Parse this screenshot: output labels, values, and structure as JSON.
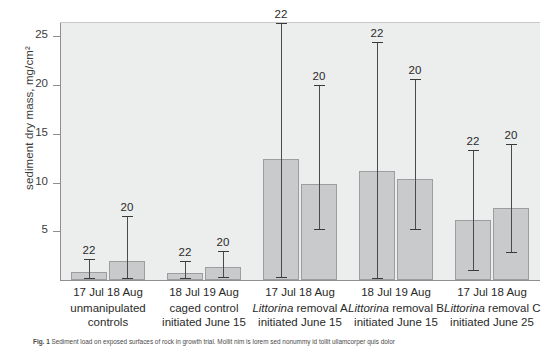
{
  "chart_data": {
    "type": "bar",
    "title": "",
    "xlabel": "",
    "ylabel": "sediment dry mass, mg/cm²",
    "ylim": [
      0,
      26.5
    ],
    "yticks": [
      5,
      10,
      15,
      20,
      25
    ],
    "ytick_labels": [
      "5",
      "10",
      "15",
      "20",
      "25"
    ],
    "grid": false,
    "legend": "none",
    "categories": [
      "unmanipulated controls",
      "caged control initiated June 15",
      "Littorina removal A initiated June 15",
      "Littorina removal B initiated June 15",
      "Littorina removal C initiated June 25"
    ],
    "series": [
      {
        "name": "July sampling",
        "values": [
          0.8,
          0.7,
          12.4,
          11.2,
          6.2
        ],
        "error_low": [
          0.2,
          0.2,
          0.3,
          0.2,
          1.0
        ],
        "error_high": [
          2.2,
          2.0,
          26.4,
          24.4,
          13.3
        ],
        "sample_sizes": [
          22,
          22,
          22,
          22,
          22
        ],
        "date_labels": [
          "17 Jul",
          "18 Jul",
          "17 Jul",
          "18 Jul",
          "17 Jul"
        ]
      },
      {
        "name": "August sampling",
        "values": [
          1.9,
          1.3,
          9.8,
          10.4,
          7.4
        ],
        "error_low": [
          0.2,
          0.3,
          5.2,
          5.2,
          2.9
        ],
        "error_high": [
          6.6,
          3.0,
          20.0,
          20.6,
          14.0
        ],
        "sample_sizes": [
          20,
          20,
          20,
          20,
          20
        ],
        "date_labels": [
          "18 Aug",
          "19 Aug",
          "18 Aug",
          "19 Aug",
          "18 Aug"
        ]
      }
    ],
    "colors": {
      "bar_fill": "#c9cacb",
      "bar_border": "#9b9d9e",
      "plot_background": "#eceded",
      "axis": "#8d8f90",
      "text": "#2a2a2a"
    }
  },
  "axis": {
    "y_label": "sediment dry mass, mg/cm²",
    "ticks": [
      {
        "value": "25"
      },
      {
        "value": "20"
      },
      {
        "value": "15"
      },
      {
        "value": "10"
      },
      {
        "value": "5"
      }
    ]
  },
  "groups": [
    {
      "dates": "17 Jul 18 Aug",
      "name_line1": "unmanipulated",
      "name_line2": "controls",
      "italic_prefix": "",
      "n_july": "22",
      "n_august": "20"
    },
    {
      "dates": "18 Jul 19 Aug",
      "name_line1": "caged control",
      "name_line2": "initiated June 15",
      "italic_prefix": "",
      "n_july": "22",
      "n_august": "20"
    },
    {
      "dates": "17 Jul 18 Aug",
      "name_line1": "removal A",
      "name_line2": "initiated June 15",
      "italic_prefix": "Littorina",
      "n_july": "22",
      "n_august": "20"
    },
    {
      "dates": "18 Jul 19 Aug",
      "name_line1": "removal B",
      "name_line2": "initiated June 15",
      "italic_prefix": "Littorina",
      "n_july": "22",
      "n_august": "20"
    },
    {
      "dates": "17 Jul 18 Aug",
      "name_line1": "removal C",
      "name_line2": "initiated June 25",
      "italic_prefix": "Littorina",
      "n_july": "22",
      "n_august": "20"
    }
  ],
  "caption": {
    "label": "Fig. 1",
    "text": "Sediment load on exposed surfaces of rock in growth trial. Mollit nim is lorem sed nonummy id tollit ullamcorper quis dolor"
  }
}
